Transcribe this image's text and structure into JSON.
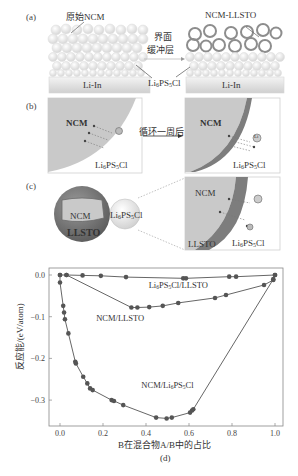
{
  "panels": {
    "a": {
      "label": "(a)",
      "left_label": "原始NCM",
      "right_label": "NCM-LLSTO",
      "arrow_label_line1": "界面",
      "arrow_label_line2": "缓冲层",
      "electrolyte_label": "Li6PS5Cl",
      "electrolyte_parts": {
        "pre": "Li",
        "sub1": "6",
        "mid": "PS",
        "sub2": "5",
        "post": "Cl"
      },
      "anode_left": "Li-In",
      "anode_right": "Li-In"
    },
    "b": {
      "label": "(b)",
      "arrow_label": "循环一周后",
      "left_particle": "NCM",
      "right_particle": "NCM",
      "electrolyte_label": "Li6PS5Cl",
      "ion_label": "Li"
    },
    "c": {
      "label": "(c)",
      "core_label": "NCM",
      "shell_label": "LLSTO",
      "electrolyte_label": "Li6PS5Cl",
      "zoom_core_label": "NCM",
      "zoom_shell_label": "LLSTO",
      "zoom_electrolyte_label": "Li6PS5Cl",
      "ion_label": "Li"
    },
    "d": {
      "label": "(d)"
    }
  },
  "colors": {
    "ncm_fill": "#c9c9c9",
    "llsto_shell": "#7d7d7d",
    "series": "#555555",
    "axis": "#888888"
  },
  "chart_data": {
    "type": "line",
    "title": "",
    "xlabel": "B在混合物A/B中的占比",
    "ylabel": "反应能/(eV/atom)",
    "xlim": [
      -0.05,
      1.05
    ],
    "ylim": [
      -0.36,
      0.01
    ],
    "xticks": [
      "0.0",
      "0.2",
      "0.4",
      "0.6",
      "0.8",
      "1.0"
    ],
    "yticks": [
      "0.0",
      "-0.1",
      "-0.2",
      "-0.3"
    ],
    "grid": false,
    "legend": "inline annotations",
    "series": [
      {
        "name": "Li6PS5Cl/LLSTO",
        "x": [
          0.0,
          0.03,
          0.105,
          0.19,
          0.307,
          0.573,
          0.586,
          0.787,
          0.819,
          1.0
        ],
        "y": [
          0.0,
          0.0,
          -0.001,
          -0.002,
          -0.005,
          -0.008,
          -0.008,
          -0.004,
          -0.004,
          0.0
        ]
      },
      {
        "name": "NCM/LLSTO",
        "x": [
          0.03,
          0.332,
          0.36,
          0.415,
          0.478,
          0.55,
          0.721,
          0.772,
          0.949,
          0.992
        ],
        "y": [
          0.0,
          -0.078,
          -0.078,
          -0.077,
          -0.074,
          -0.067,
          -0.055,
          -0.048,
          -0.024,
          -0.012
        ]
      },
      {
        "name": "NCM/Li6PS5Cl",
        "x": [
          0.0,
          0.0,
          0.015,
          0.019,
          0.023,
          0.039,
          0.071,
          0.074,
          0.108,
          0.127,
          0.14,
          0.152,
          0.24,
          0.251,
          0.294,
          0.447,
          0.496,
          0.52,
          0.605,
          0.614,
          0.62,
          0.992,
          1.0
        ],
        "y": [
          0.0,
          -0.018,
          -0.074,
          -0.09,
          -0.106,
          -0.14,
          -0.208,
          -0.212,
          -0.244,
          -0.26,
          -0.272,
          -0.276,
          -0.3,
          -0.302,
          -0.312,
          -0.342,
          -0.344,
          -0.342,
          -0.33,
          -0.325,
          -0.322,
          -0.01,
          0.0
        ]
      }
    ],
    "annotations": [
      {
        "text": "Li6PS5Cl/LLSTO",
        "x": 0.55,
        "y": -0.03
      },
      {
        "text": "NCM/LLSTO",
        "x": 0.28,
        "y": -0.11
      },
      {
        "text": "NCM/Li6PS5Cl",
        "x": 0.5,
        "y": -0.27
      }
    ],
    "caption": "(d)"
  }
}
